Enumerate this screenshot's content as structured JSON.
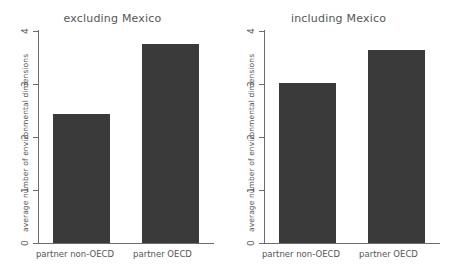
{
  "chart_data": {
    "type": "bar",
    "title": "",
    "xlabel": "",
    "ylabel": "average number of environmental dimensions",
    "ylim": [
      0,
      4
    ],
    "yticks": [
      "0",
      "1",
      "2",
      "3",
      "4"
    ],
    "grid": false,
    "legend": null,
    "categories": [
      "partner non-OECD",
      "partner OECD"
    ],
    "panels": [
      {
        "title": "excluding Mexico",
        "categories": [
          "partner non-OECD",
          "partner OECD"
        ],
        "values": [
          2.42,
          3.73
        ],
        "ylabel": "average number of environmental dimensions",
        "ylim": [
          0,
          4
        ],
        "yticks": [
          "0",
          "1",
          "2",
          "3",
          "4"
        ]
      },
      {
        "title": "including Mexico",
        "categories": [
          "partner non-OECD",
          "partner OECD"
        ],
        "values": [
          3.0,
          3.62
        ],
        "ylabel": "average number of environmental dimensions",
        "ylim": [
          0,
          4
        ],
        "yticks": [
          "0",
          "1",
          "2",
          "3",
          "4"
        ]
      }
    ],
    "bar_color": "#3a3a3a",
    "axis_color": "#6b6b6b",
    "background_color": "#ffffff"
  }
}
